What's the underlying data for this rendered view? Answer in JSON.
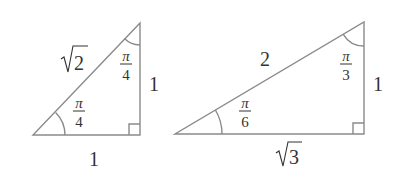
{
  "diagram": {
    "title": "",
    "stroke_color": "#8a8a8a",
    "text_color": "#333333",
    "triangles": [
      {
        "name": "45-45-90 triangle",
        "hypotenuse_label_radicand": "2",
        "vertical_leg_label": "1",
        "horizontal_leg_label": "1",
        "top_angle": {
          "num": "π",
          "den": "4"
        },
        "bottom_angle": {
          "num": "π",
          "den": "4"
        },
        "right_angle_marker": true
      },
      {
        "name": "30-60-90 triangle",
        "hypotenuse_label": "2",
        "vertical_leg_label": "1",
        "horizontal_leg_label_radicand": "3",
        "top_angle": {
          "num": "π",
          "den": "3"
        },
        "bottom_angle": {
          "num": "π",
          "den": "6"
        },
        "right_angle_marker": true
      }
    ]
  }
}
